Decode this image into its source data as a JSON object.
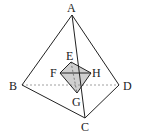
{
  "figure": {
    "type": "tetrahedron with inscribed quadrilateral",
    "points": {
      "A": {
        "label": "A",
        "x": 72,
        "y": 15
      },
      "B": {
        "label": "B",
        "x": 22,
        "y": 85
      },
      "C": {
        "label": "C",
        "x": 85,
        "y": 118
      },
      "D": {
        "label": "D",
        "x": 119,
        "y": 85
      },
      "E": {
        "label": "E",
        "x": 71,
        "y": 62
      },
      "F": {
        "label": "F",
        "x": 60,
        "y": 73
      },
      "H": {
        "label": "H",
        "x": 91,
        "y": 73
      },
      "G": {
        "label": "G",
        "x": 77,
        "y": 93
      }
    },
    "solid_edges": [
      "AB",
      "AD",
      "AC",
      "BC",
      "CD",
      "EF",
      "EH",
      "FH",
      "FG",
      "GH"
    ],
    "dashed_edges": [
      "BD",
      "EG"
    ],
    "shaded_region": [
      "E",
      "F",
      "G",
      "H"
    ],
    "colors": {
      "line": "#222222",
      "shade": "#c8c8c8",
      "dash": "#888888"
    }
  }
}
